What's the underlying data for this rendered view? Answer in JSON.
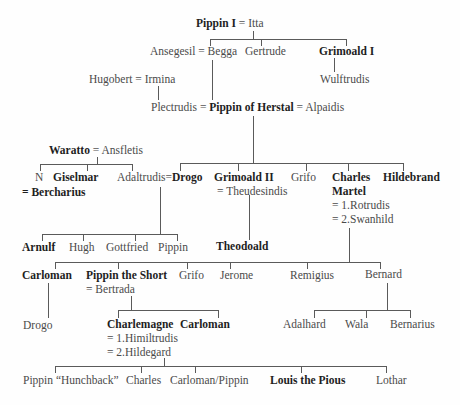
{
  "diagram": {
    "type": "family-tree",
    "title": "",
    "generations": [
      {
        "level": 1,
        "couples": [
          {
            "person": "Pippin I",
            "person_bold": true,
            "spouse": "Itta"
          }
        ]
      },
      {
        "level": 2,
        "members": [
          {
            "couple": {
              "person": "Ansegesil",
              "spouse": "Begga"
            }
          },
          {
            "person": "Gertrude"
          },
          {
            "person": "Grimoald I",
            "bold": true
          }
        ]
      }
    ],
    "nodes": {
      "pippin_i": {
        "name": "Pippin I",
        "bold": true
      },
      "pippin_i_eq": "=",
      "itta": {
        "name": "Itta"
      },
      "ansegesil": {
        "name": "Ansegesil"
      },
      "ansegesil_eq": "=",
      "begga": {
        "name": "Begga"
      },
      "gertrude": {
        "name": "Gertrude"
      },
      "grimoald_i": {
        "name": "Grimoald I",
        "bold": true
      },
      "wulftrudis": {
        "name": "Wulftrudis"
      },
      "hugobert": {
        "name": "Hugobert"
      },
      "hugobert_eq": "=",
      "irmina": {
        "name": "Irmina"
      },
      "plectrudis": {
        "name": "Plectrudis"
      },
      "plectrudis_eq": "=",
      "pippin_of_herstal": {
        "name": "Pippin of Herstal",
        "bold": true
      },
      "alpaidis_eq": "=",
      "alpaidis": {
        "name": "Alpaidis"
      },
      "waratto": {
        "name": "Waratto",
        "bold": true
      },
      "waratto_eq": "=",
      "ansfletis": {
        "name": "Ansfletis"
      },
      "n": {
        "name": "N"
      },
      "bercharius_line": "= Bercharius",
      "bercharius": {
        "name": "Bercharius",
        "bold": true
      },
      "giselmar": {
        "name": "Giselmar",
        "bold": true
      },
      "adaltrudis": {
        "name": "Adaltrudis"
      },
      "adaltrudis_eq": "=",
      "drogo": {
        "name": "Drogo",
        "bold": true
      },
      "grimoald_ii": {
        "name": "Grimoald II",
        "bold": true
      },
      "theudesindis_line": "= Theudesindis",
      "grifo_1": {
        "name": "Grifo"
      },
      "charles_martel_1": "Charles",
      "charles_martel_2": "Martel",
      "charles_martel_spouse_1": "= 1.Rotrudis",
      "charles_martel_spouse_2": "= 2.Swanhild",
      "hildebrand": {
        "name": "Hildebrand",
        "bold": true
      },
      "arnulf": {
        "name": "Arnulf",
        "bold": true
      },
      "hugh": {
        "name": "Hugh"
      },
      "gottfried": {
        "name": "Gottfried"
      },
      "pippin_drogo_son": {
        "name": "Pippin"
      },
      "theodoald": {
        "name": "Theodoald",
        "bold": true
      },
      "carloman_1": {
        "name": "Carloman",
        "bold": true
      },
      "pippin_the_short": {
        "name": "Pippin the Short",
        "bold": true
      },
      "bertrada_line": "= Bertrada",
      "grifo_2": {
        "name": "Grifo"
      },
      "jerome": {
        "name": "Jerome"
      },
      "remigius": {
        "name": "Remigius"
      },
      "bernard": {
        "name": "Bernard"
      },
      "drogo_2": {
        "name": "Drogo"
      },
      "charlemagne": {
        "name": "Charlemagne",
        "bold": true
      },
      "charlemagne_spouse_1": "= 1.Himiltrudis",
      "charlemagne_spouse_2": "= 2.Hildegard",
      "carloman_2": {
        "name": "Carloman",
        "bold": true
      },
      "adalhard": {
        "name": "Adalhard"
      },
      "wala": {
        "name": "Wala"
      },
      "bernarius": {
        "name": "Bernarius"
      },
      "pippin_hunchback": {
        "name": "Pippin “Hunchback”"
      },
      "charles_young": {
        "name": "Charles"
      },
      "carloman_pippin": {
        "name": "Carloman/Pippin"
      },
      "louis_the_pious": {
        "name": "Louis the Pious",
        "bold": true
      },
      "lothar": {
        "name": "Lothar"
      }
    },
    "relations": [
      {
        "parents": [
          "Pippin I",
          "Itta"
        ],
        "children": [
          "Begga",
          "Gertrude",
          "Grimoald I"
        ]
      },
      {
        "parents": [
          "Grimoald I"
        ],
        "children": [
          "Wulftrudis"
        ]
      },
      {
        "parents": [
          "Hugobert",
          "Irmina"
        ],
        "children": [
          "Plectrudis"
        ]
      },
      {
        "parents": [
          "Ansegesil",
          "Begga"
        ],
        "children": [
          "Pippin of Herstal"
        ]
      },
      {
        "parents": [
          "Pippin of Herstal"
        ],
        "children": [
          "Drogo",
          "Grimoald II",
          "Grifo",
          "Charles Martel",
          "Hildebrand"
        ]
      },
      {
        "parents": [
          "Waratto",
          "Ansfletis"
        ],
        "children": [
          "N",
          "Giselmar",
          "Adaltrudis"
        ]
      },
      {
        "parents": [
          "Adaltrudis",
          "Drogo"
        ],
        "children": [
          "Arnulf",
          "Hugh",
          "Gottfried",
          "Pippin"
        ]
      },
      {
        "parents": [
          "Grimoald II",
          "Theudesindis"
        ],
        "children": [
          "Theodoald"
        ]
      },
      {
        "parents": [
          "Charles Martel"
        ],
        "children": [
          "Carloman",
          "Pippin the Short",
          "Grifo",
          "Jerome",
          "Remigius",
          "Bernard"
        ]
      },
      {
        "parents": [
          "Carloman"
        ],
        "children": [
          "Drogo"
        ]
      },
      {
        "parents": [
          "Pippin the Short",
          "Bertrada"
        ],
        "children": [
          "Charlemagne",
          "Carloman"
        ]
      },
      {
        "parents": [
          "Bernard"
        ],
        "children": [
          "Adalhard",
          "Wala",
          "Bernarius"
        ]
      },
      {
        "parents": [
          "Charlemagne",
          "Hildegard"
        ],
        "children": [
          "Pippin “Hunchback”",
          "Charles",
          "Carloman/Pippin",
          "Louis the Pious",
          "Lothar"
        ]
      }
    ],
    "colors": {
      "background": "#fefefe",
      "line": "#5a5a5a",
      "text": "#4a4a4a",
      "bold_text": "#1e1e1e"
    }
  }
}
